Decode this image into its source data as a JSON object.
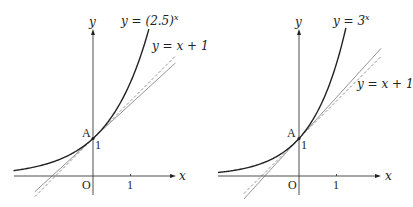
{
  "figure": {
    "background": "#ffffff",
    "stroke_color": "#222222",
    "line_color": "#666666",
    "panels": [
      {
        "id": "left",
        "curve_label": {
          "prefix": "y = (2.5)",
          "exponent": "x"
        },
        "line_label": "y = x + 1",
        "axis_x_label": "x",
        "axis_y_label": "y",
        "origin_label": "O",
        "tick_x_label": "1",
        "tick_y_label": "1",
        "point_label": "A",
        "base": 2.5,
        "origin_px": [
          93,
          176
        ],
        "unit_px": 37.5,
        "x_axis_px": [
          14,
          176
        ],
        "y_axis_px": [
          195,
          29
        ],
        "curve_x_range": [
          -2.12,
          1.49
        ],
        "line_x_range": [
          -1.55,
          2.2
        ],
        "curve_label_pos": [
          121,
          14
        ],
        "line_label_pos": [
          152,
          40
        ],
        "y_label_pos": [
          89,
          16
        ],
        "x_label_pos": [
          179,
          170
        ],
        "origin_label_pos": [
          82,
          179
        ],
        "tick_label_pos": [
          127,
          179
        ],
        "tick_y_label_pos": [
          95,
          139
        ],
        "point_label_pos": [
          82,
          127
        ]
      },
      {
        "id": "right",
        "curve_label": {
          "prefix": "y = 3",
          "exponent": "x"
        },
        "line_label": "y = x + 1",
        "axis_x_label": "x",
        "axis_y_label": "y",
        "origin_label": "O",
        "tick_x_label": "1",
        "tick_y_label": "1",
        "point_label": "A",
        "base": 3,
        "origin_px": [
          299,
          176
        ],
        "unit_px": 37.5,
        "x_axis_px": [
          218,
          381
        ],
        "y_axis_px": [
          195,
          29
        ],
        "curve_x_range": [
          -2.16,
          1.25
        ],
        "line_x_range": [
          -1.47,
          2.19
        ],
        "curve_label_pos": [
          333,
          14
        ],
        "line_label_pos": [
          357,
          78
        ],
        "y_label_pos": [
          295,
          16
        ],
        "x_label_pos": [
          385,
          170
        ],
        "origin_label_pos": [
          288,
          179
        ],
        "tick_label_pos": [
          333,
          179
        ],
        "tick_y_label_pos": [
          301,
          139
        ],
        "point_label_pos": [
          287,
          127
        ]
      }
    ]
  }
}
